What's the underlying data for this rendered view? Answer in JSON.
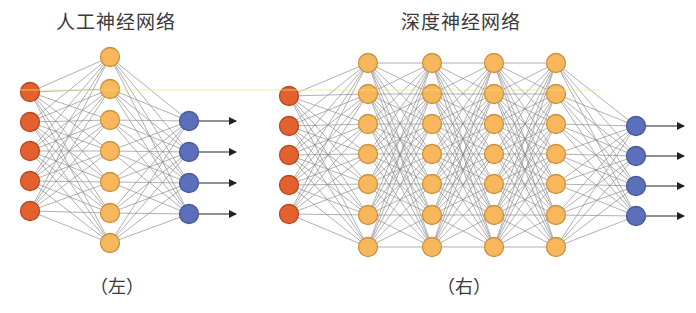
{
  "colors": {
    "input_fill": "#e2612f",
    "input_stroke": "#b9481f",
    "hidden_fill": "#f8b75c",
    "hidden_stroke": "#c99240",
    "output_fill": "#5c6fba",
    "output_stroke": "#48599b",
    "edge": "#8a8a8a",
    "arrow": "#222222",
    "artifact_line": "#f3e07a"
  },
  "networks": [
    {
      "id": "left",
      "title": "人工神经网络",
      "caption": "（左）",
      "node_radius": 9.5,
      "layers": [
        {
          "type": "input",
          "x": 30,
          "ys": [
            92,
            122,
            151,
            181,
            211
          ]
        },
        {
          "type": "hidden",
          "x": 110,
          "ys": [
            57,
            89,
            120,
            151,
            182,
            213,
            243
          ]
        },
        {
          "type": "output",
          "x": 189,
          "ys": [
            121,
            152,
            183,
            214
          ]
        }
      ],
      "arrow_end_x": 236
    },
    {
      "id": "right",
      "title": "深度神经网络",
      "caption": "（右）",
      "node_radius": 9.5,
      "layers": [
        {
          "type": "input",
          "x": 289,
          "ys": [
            96,
            126,
            155,
            185,
            214
          ]
        },
        {
          "type": "hidden",
          "x": 368,
          "ys": [
            63,
            94,
            124,
            154,
            184,
            215,
            247
          ]
        },
        {
          "type": "hidden",
          "x": 432,
          "ys": [
            63,
            94,
            124,
            154,
            184,
            215,
            247
          ]
        },
        {
          "type": "hidden",
          "x": 494,
          "ys": [
            63,
            94,
            124,
            154,
            184,
            215,
            247
          ]
        },
        {
          "type": "hidden",
          "x": 556,
          "ys": [
            63,
            94,
            124,
            154,
            184,
            215,
            247
          ]
        },
        {
          "type": "output",
          "x": 636,
          "ys": [
            126,
            156,
            186,
            216
          ]
        }
      ],
      "arrow_end_x": 684
    }
  ],
  "artifact_line_y": 90
}
